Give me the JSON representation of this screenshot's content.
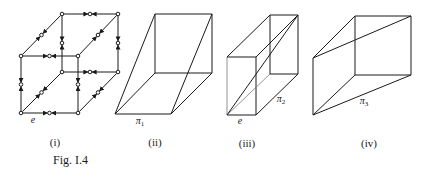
{
  "figure": {
    "caption": "Fig. I.4",
    "stroke_color": "#1a1a1a",
    "panels": [
      {
        "id": "i",
        "caption": "(i)",
        "description": "cube graph with midpoint nodes on every edge, arrows directed toward edge midpoints",
        "vertex_label": "e"
      },
      {
        "id": "ii",
        "caption": "(ii)",
        "description": "prism with parallelogram base, face labelled pi_1",
        "face_label": "π",
        "face_sub": "1"
      },
      {
        "id": "iii",
        "caption": "(iii)",
        "description": "rectangular box with a diagonal, vertex e and face pi_2",
        "vertex_label": "e",
        "face_label": "π",
        "face_sub": "2"
      },
      {
        "id": "iv",
        "caption": "(iv)",
        "description": "wedge/pyramid-like solid converging to front edge, face pi_3",
        "face_label": "π",
        "face_sub": "3"
      }
    ]
  }
}
